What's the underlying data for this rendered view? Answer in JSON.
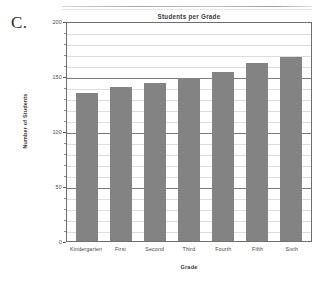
{
  "figure": {
    "letter": "C."
  },
  "chart_data": {
    "type": "bar",
    "title": "Students per Grade",
    "xlabel": "Grade",
    "ylabel": "Number of Students",
    "categories": [
      "Kindergarten",
      "First",
      "Second",
      "Third",
      "Fourth",
      "Fifth",
      "Sixth"
    ],
    "values": [
      135,
      140,
      144,
      148,
      154,
      162,
      167
    ],
    "ylim": [
      0,
      200
    ],
    "ytick_labels": [
      "0",
      "50",
      "100",
      "150",
      "200"
    ],
    "ytick_values": [
      0,
      50,
      100,
      150,
      200
    ],
    "minor_gridline_step": 10,
    "grid": true,
    "legend": false,
    "bar_color": "#838383",
    "axis_color": "#6f6f6f",
    "major_gridline_color": "#7a7a7a",
    "minor_gridline_color": "#dcdcdc"
  }
}
